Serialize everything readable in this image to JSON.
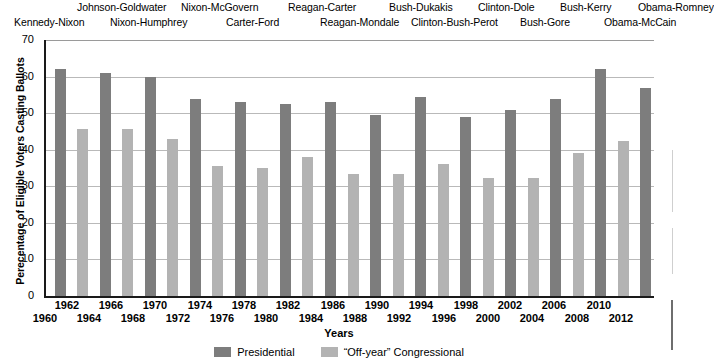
{
  "chart_data": {
    "type": "bar",
    "title": "",
    "xlabel": "Years",
    "ylabel": "Perecentage of Eligible Voters Casting Ballots",
    "ylim": [
      0,
      70
    ],
    "yticks": [
      0,
      10,
      20,
      30,
      40,
      50,
      60,
      70
    ],
    "grid": true,
    "legend_position": "bottom",
    "categories": [
      "1960",
      "1962",
      "1964",
      "1966",
      "1968",
      "1970",
      "1972",
      "1974",
      "1976",
      "1978",
      "1980",
      "1982",
      "1984",
      "1986",
      "1988",
      "1990",
      "1992",
      "1994",
      "1996",
      "1998",
      "2000",
      "2002",
      "2004",
      "2006",
      "2008",
      "2010",
      "2012"
    ],
    "series": [
      {
        "name": "Presidential",
        "color": "#7d7d7d",
        "points": [
          {
            "year": "1960",
            "value": 62
          },
          {
            "year": "1964",
            "value": 61
          },
          {
            "year": "1968",
            "value": 60
          },
          {
            "year": "1972",
            "value": 54
          },
          {
            "year": "1976",
            "value": 53
          },
          {
            "year": "1980",
            "value": 52.5
          },
          {
            "year": "1984",
            "value": 53
          },
          {
            "year": "1988",
            "value": 49.5
          },
          {
            "year": "1992",
            "value": 54.5
          },
          {
            "year": "1996",
            "value": 49
          },
          {
            "year": "2000",
            "value": 51
          },
          {
            "year": "2004",
            "value": 54
          },
          {
            "year": "2008",
            "value": 62
          },
          {
            "year": "2012",
            "value": 57
          }
        ]
      },
      {
        "name": "“Off-year” Congressional",
        "color": "#b3b3b3",
        "points": [
          {
            "year": "1962",
            "value": 45.8
          },
          {
            "year": "1966",
            "value": 45.8
          },
          {
            "year": "1970",
            "value": 43
          },
          {
            "year": "1974",
            "value": 35.5
          },
          {
            "year": "1978",
            "value": 35
          },
          {
            "year": "1982",
            "value": 38
          },
          {
            "year": "1986",
            "value": 33.3
          },
          {
            "year": "1990",
            "value": 33.3
          },
          {
            "year": "1994",
            "value": 36
          },
          {
            "year": "1998",
            "value": 32.2
          },
          {
            "year": "2002",
            "value": 32.2
          },
          {
            "year": "2006",
            "value": 39
          },
          {
            "year": "2010",
            "value": 42.5
          }
        ]
      }
    ]
  },
  "axes": {
    "y_title": "Perecentage of Eligible Voters Casting Ballots",
    "x_title": "Years",
    "y_ticks": [
      "70",
      "60",
      "50",
      "40",
      "30",
      "20",
      "10",
      "0"
    ],
    "x_ticks_upper": [
      "1962",
      "1966",
      "1970",
      "1974",
      "1978",
      "1982",
      "1986",
      "1990",
      "1994",
      "1998",
      "2002",
      "2006",
      "2010"
    ],
    "x_ticks_lower": [
      "1960",
      "1964",
      "1968",
      "1972",
      "1976",
      "1980",
      "1984",
      "1988",
      "1992",
      "1996",
      "2000",
      "2004",
      "2008",
      "2012"
    ]
  },
  "elections": {
    "row_upper": [
      "Johnson-Goldwater",
      "Nixon-McGovern",
      "Reagan-Carter",
      "Bush-Dukakis",
      "Clinton-Dole",
      "Bush-Kerry",
      "Obama-Romney"
    ],
    "row_lower": [
      "Kennedy-Nixon",
      "Nixon-Humphrey",
      "Carter-Ford",
      "Reagan-Mondale",
      "Clinton-Bush-Perot",
      "Bush-Gore",
      "Obama-McCain"
    ]
  },
  "legend": {
    "items": [
      {
        "label": "Presidential",
        "color": "#7d7d7d"
      },
      {
        "label": "“Off-year” Congressional",
        "color": "#b3b3b3"
      }
    ]
  }
}
